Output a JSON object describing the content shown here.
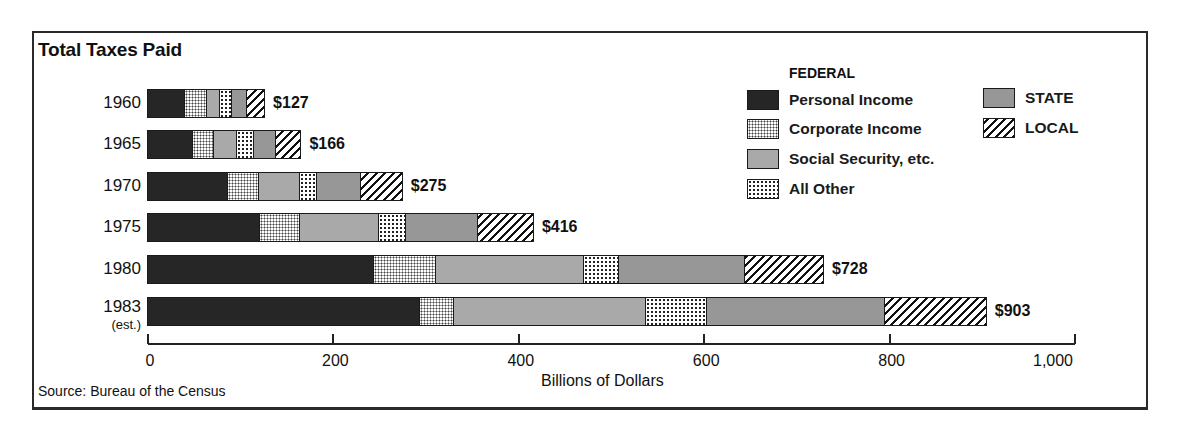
{
  "chart_data": {
    "type": "bar",
    "orientation": "horizontal",
    "stacked": true,
    "title": "Total Taxes Paid",
    "xlabel": "Billions of Dollars",
    "ylabel": "",
    "xlim": [
      0,
      1000
    ],
    "xticks": [
      0,
      200,
      400,
      600,
      800,
      1000
    ],
    "xtick_labels": [
      "0",
      "200",
      "400",
      "600",
      "800",
      "1,000"
    ],
    "grid": false,
    "legend_position": "upper right",
    "legend_groups": [
      {
        "heading": "FEDERAL",
        "entries": [
          "Personal Income",
          "Corporate Income",
          "Social Security, etc.",
          "All Other"
        ]
      },
      {
        "heading": "",
        "entries": [
          "STATE",
          "LOCAL"
        ]
      }
    ],
    "categories": [
      "1960",
      "1965",
      "1970",
      "1975",
      "1980",
      "1983"
    ],
    "category_sublabels": [
      "",
      "",
      "",
      "",
      "",
      "(est.)"
    ],
    "totals": [
      127,
      166,
      275,
      416,
      728,
      903
    ],
    "total_labels": [
      "$127",
      "$166",
      "$275",
      "$416",
      "$728",
      "$903"
    ],
    "series": [
      {
        "name": "Personal Income",
        "group": "FEDERAL",
        "pattern": "solid-dark",
        "values": [
          41,
          49,
          87,
          122,
          244,
          294
        ]
      },
      {
        "name": "Corporate Income",
        "group": "FEDERAL",
        "pattern": "fine-dots",
        "values": [
          24,
          23,
          33,
          42,
          67,
          36
        ]
      },
      {
        "name": "Social Security, etc.",
        "group": "FEDERAL",
        "pattern": "light-gray",
        "values": [
          14,
          25,
          45,
          85,
          159,
          207
        ]
      },
      {
        "name": "All Other",
        "group": "FEDERAL",
        "pattern": "coarse-dots",
        "values": [
          12,
          18,
          18,
          29,
          38,
          65
        ]
      },
      {
        "name": "STATE",
        "group": "STATE",
        "pattern": "medium-gray",
        "values": [
          17,
          24,
          47,
          78,
          135,
          192
        ]
      },
      {
        "name": "LOCAL",
        "group": "LOCAL",
        "pattern": "diagonal-hatch",
        "values": [
          19,
          27,
          45,
          60,
          85,
          109
        ]
      }
    ],
    "source": "Source: Bureau of the Census"
  },
  "title": "Total Taxes Paid",
  "legend": {
    "federal_heading": "FEDERAL",
    "items": [
      {
        "label": "Personal Income",
        "pattern": "p-personal"
      },
      {
        "label": "Corporate Income",
        "pattern": "p-corporate"
      },
      {
        "label": "Social Security, etc.",
        "pattern": "p-social"
      },
      {
        "label": "All Other",
        "pattern": "p-other"
      },
      {
        "label": "STATE",
        "pattern": "p-state"
      },
      {
        "label": "LOCAL",
        "pattern": "p-local"
      }
    ]
  },
  "axis": {
    "xlabel": "Billions of Dollars",
    "ticks": [
      "0",
      "200",
      "400",
      "600",
      "800",
      "1,000"
    ]
  },
  "source": "Source: Bureau of the Census",
  "colors": {
    "personal": "#262626",
    "social_security": "#a9a9a9",
    "state": "#979797",
    "frame": "#2a2a2a"
  }
}
